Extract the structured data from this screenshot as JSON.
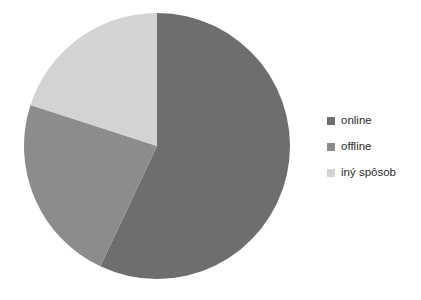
{
  "chart_data": {
    "type": "pie",
    "title": "",
    "subtitle": "",
    "xlabel": "",
    "ylabel": "",
    "grid": false,
    "legend_position": "right",
    "start_angle_deg": 0,
    "direction": "clockwise",
    "center": {
      "x": 157,
      "y": 146
    },
    "radius": 133,
    "categories": [
      "online",
      "offline",
      "iný spôsob"
    ],
    "values": [
      57,
      23,
      20
    ],
    "unit": "%",
    "colors": [
      "#6e6e6e",
      "#8c8c8c",
      "#d3d3d3"
    ],
    "slices": [
      {
        "label": "online",
        "value": 57,
        "color": "#6e6e6e",
        "start_angle_deg": 0,
        "end_angle_deg": 205.2
      },
      {
        "label": "offline",
        "value": 23,
        "color": "#8c8c8c",
        "start_angle_deg": 205.2,
        "end_angle_deg": 288.0
      },
      {
        "label": "iný spôsob",
        "value": 20,
        "color": "#d3d3d3",
        "start_angle_deg": 288.0,
        "end_angle_deg": 360.0
      }
    ],
    "data_labels_visible": false,
    "annotations": []
  },
  "legend": {
    "items": [
      {
        "label": "online",
        "color": "#6e6e6e",
        "marker": "square-marker"
      },
      {
        "label": "offline",
        "color": "#8c8c8c",
        "marker": "square-marker"
      },
      {
        "label": "iný spôsob",
        "color": "#d3d3d3",
        "marker": "square-marker"
      }
    ]
  },
  "canvas": {
    "background": "#ffffff"
  }
}
